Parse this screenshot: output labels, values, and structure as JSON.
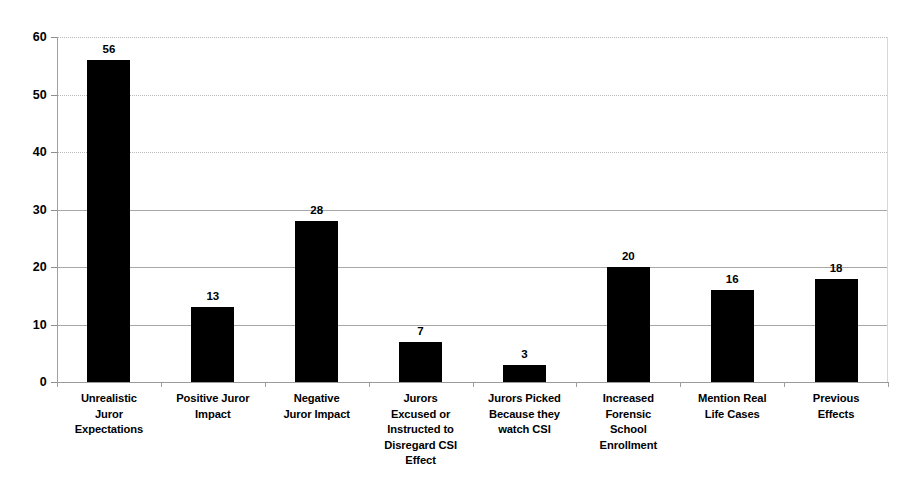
{
  "chart_data": {
    "type": "bar",
    "title": "",
    "subtitle": "",
    "xlabel": "",
    "ylabel": "",
    "ylim": [
      0,
      60
    ],
    "yticks": [
      0,
      10,
      20,
      30,
      40,
      50,
      60
    ],
    "ytick_labels": [
      "0",
      "10",
      "20",
      "30",
      "40",
      "50",
      "60"
    ],
    "grid": true,
    "grid_axis": "y",
    "legend": false,
    "legend_position": "none",
    "bar_color": "#000000",
    "categories": [
      "Unrealistic Juror Expectations",
      "Positive Juror Impact",
      "Negative Juror Impact",
      "Jurors Excused or Instructed to Disregard CSI Effect",
      "Jurors Picked Because they watch CSI",
      "Increased Forensic School Enrollment",
      "Mention Real Life Cases",
      "Previous Effects"
    ],
    "category_lines": [
      [
        "Unrealistic",
        "Juror",
        "Expectations"
      ],
      [
        "Positive Juror",
        "Impact"
      ],
      [
        "Negative",
        "Juror Impact"
      ],
      [
        "Jurors",
        "Excused or",
        "Instructed to",
        "Disregard CSI",
        "Effect"
      ],
      [
        "Jurors Picked",
        "Because they",
        "watch CSI"
      ],
      [
        "Increased",
        "Forensic",
        "School",
        "Enrollment"
      ],
      [
        "Mention Real",
        "Life Cases"
      ],
      [
        "Previous",
        "Effects"
      ]
    ],
    "values": [
      56,
      13,
      28,
      7,
      3,
      20,
      16,
      18
    ],
    "value_labels": [
      "56",
      "13",
      "28",
      "7",
      "3",
      "20",
      "16",
      "18"
    ]
  },
  "colors": {
    "background": "#ffffff",
    "bar": "#000000",
    "gridline": "#b9b9b9",
    "axis": "#9a9a9a",
    "text": "#000000"
  }
}
